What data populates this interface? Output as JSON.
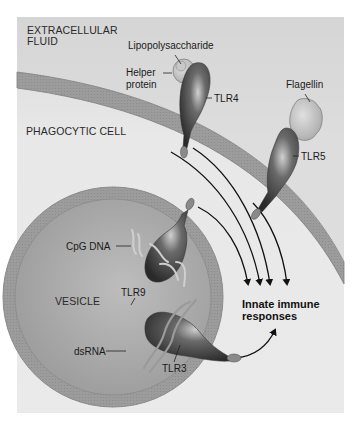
{
  "figure": {
    "regions": {
      "extracellular": "EXTRACELLULAR FLUID",
      "extracellular_line1": "EXTRACELLULAR",
      "extracellular_line2": "FLUID",
      "phagocytic_cell": "PHAGOCYTIC CELL",
      "vesicle": "VESICLE"
    },
    "ligands": {
      "lps": "Lipopolysaccharide",
      "helper_line1": "Helper",
      "helper_line2": "protein",
      "flagellin": "Flagellin",
      "cpg": "CpG DNA",
      "dsrna": "dsRNA"
    },
    "receptors": {
      "tlr4": "TLR4",
      "tlr5": "TLR5",
      "tlr9": "TLR9",
      "tlr3": "TLR3"
    },
    "output": {
      "line1": "Innate immune",
      "line2": "responses"
    },
    "colors": {
      "panel_bg": "#e6e6e6",
      "membrane": "#9a9a9a",
      "vesicle_interior": "#a8a8a8",
      "receptor_dark": "#3a3a3a",
      "ligand_light": "#c8c8c8",
      "arrow": "#111111"
    }
  }
}
